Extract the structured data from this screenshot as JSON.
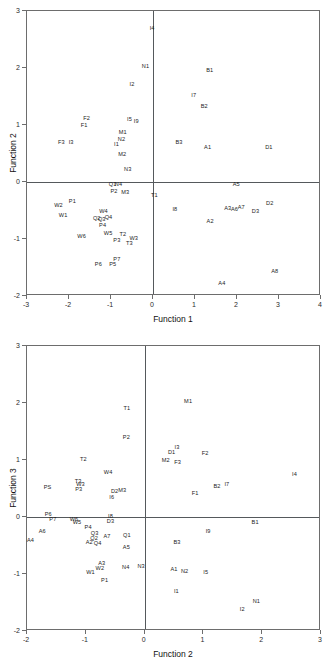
{
  "figure": {
    "background": "#ffffff",
    "axis_color": "#55595c",
    "label_color": "#1c1c1c"
  },
  "chart_data": [
    {
      "type": "scatter",
      "title": "",
      "xlabel": "Function 1",
      "ylabel": "Function 2",
      "xlim": [
        -3,
        4
      ],
      "ylim": [
        -2,
        3
      ],
      "xticks": [
        -3,
        -2,
        -1,
        0,
        1,
        2,
        3,
        4
      ],
      "xtick_labels": [
        "-3",
        "-2",
        "-1",
        "0",
        "1",
        "2",
        "3",
        "4"
      ],
      "yticks": [
        -2,
        -1,
        0,
        1,
        2,
        3
      ],
      "ytick_labels": [
        "-2",
        "-1",
        "0",
        "1",
        "2",
        "3"
      ],
      "grid": false,
      "legend": "none",
      "origin_axes": true,
      "marker": "text-label-only",
      "points": [
        {
          "label": "I4",
          "x": -0.02,
          "y": 2.7
        },
        {
          "label": "N1",
          "x": -0.18,
          "y": 2.04
        },
        {
          "label": "B1",
          "x": 1.35,
          "y": 1.97
        },
        {
          "label": "I2",
          "x": -0.5,
          "y": 1.72
        },
        {
          "label": "I7",
          "x": 0.97,
          "y": 1.52
        },
        {
          "label": "B2",
          "x": 1.22,
          "y": 1.33
        },
        {
          "label": "F2",
          "x": -1.58,
          "y": 1.13
        },
        {
          "label": "I5",
          "x": -0.56,
          "y": 1.1
        },
        {
          "label": "I9",
          "x": -0.4,
          "y": 1.07
        },
        {
          "label": "F1",
          "x": -1.64,
          "y": 1.0
        },
        {
          "label": "M1",
          "x": -0.72,
          "y": 0.87
        },
        {
          "label": "N2",
          "x": -0.75,
          "y": 0.75
        },
        {
          "label": "F3",
          "x": -2.18,
          "y": 0.7
        },
        {
          "label": "I3",
          "x": -1.95,
          "y": 0.71
        },
        {
          "label": "I1",
          "x": -0.87,
          "y": 0.67
        },
        {
          "label": "B3",
          "x": 0.62,
          "y": 0.71
        },
        {
          "label": "A1",
          "x": 1.3,
          "y": 0.62
        },
        {
          "label": "D1",
          "x": 2.76,
          "y": 0.62
        },
        {
          "label": "M2",
          "x": -0.73,
          "y": 0.49
        },
        {
          "label": "N3",
          "x": -0.6,
          "y": 0.22
        },
        {
          "label": "Q1",
          "x": -0.96,
          "y": -0.04
        },
        {
          "label": "N4",
          "x": -0.82,
          "y": -0.04
        },
        {
          "label": "A5",
          "x": 1.98,
          "y": -0.03
        },
        {
          "label": "P2",
          "x": -0.93,
          "y": -0.16
        },
        {
          "label": "M3",
          "x": -0.66,
          "y": -0.17
        },
        {
          "label": "T1",
          "x": 0.03,
          "y": -0.22
        },
        {
          "label": "P1",
          "x": -1.92,
          "y": -0.33
        },
        {
          "label": "D2",
          "x": 2.78,
          "y": -0.36
        },
        {
          "label": "W2",
          "x": -2.25,
          "y": -0.4
        },
        {
          "label": "I8",
          "x": 0.52,
          "y": -0.48
        },
        {
          "label": "A3",
          "x": 1.78,
          "y": -0.45
        },
        {
          "label": "A6",
          "x": 1.94,
          "y": -0.48
        },
        {
          "label": "A7",
          "x": 2.1,
          "y": -0.44
        },
        {
          "label": "D3",
          "x": 2.44,
          "y": -0.5
        },
        {
          "label": "W4",
          "x": -1.18,
          "y": -0.5
        },
        {
          "label": "W1",
          "x": -2.14,
          "y": -0.58
        },
        {
          "label": "Q2",
          "x": -1.34,
          "y": -0.63
        },
        {
          "label": "Q3",
          "x": -1.22,
          "y": -0.65
        },
        {
          "label": "Q4",
          "x": -1.06,
          "y": -0.62
        },
        {
          "label": "A2",
          "x": 1.36,
          "y": -0.68
        },
        {
          "label": "P4",
          "x": -1.2,
          "y": -0.76
        },
        {
          "label": "W5",
          "x": -1.07,
          "y": -0.9
        },
        {
          "label": "W6",
          "x": -1.7,
          "y": -0.95
        },
        {
          "label": "T2",
          "x": -0.72,
          "y": -0.91
        },
        {
          "label": "W3",
          "x": -0.46,
          "y": -0.98
        },
        {
          "label": "P3",
          "x": -0.86,
          "y": -1.01
        },
        {
          "label": "T3",
          "x": -0.56,
          "y": -1.07
        },
        {
          "label": "P7",
          "x": -0.86,
          "y": -1.35
        },
        {
          "label": "P6",
          "x": -1.3,
          "y": -1.43
        },
        {
          "label": "P5",
          "x": -0.96,
          "y": -1.43
        },
        {
          "label": "A8",
          "x": 2.9,
          "y": -1.56
        },
        {
          "label": "A4",
          "x": 1.64,
          "y": -1.78
        }
      ]
    },
    {
      "type": "scatter",
      "title": "",
      "xlabel": "Function 2",
      "ylabel": "Function 3",
      "xlim": [
        -2,
        3
      ],
      "ylim": [
        -2,
        3
      ],
      "xticks": [
        -2,
        -1,
        0,
        1,
        2,
        3
      ],
      "xtick_labels": [
        "-2",
        "-1",
        "0",
        "1",
        "2",
        "3"
      ],
      "yticks": [
        -2,
        -1,
        0,
        1,
        2,
        3
      ],
      "ytick_labels": [
        "-2",
        "-1",
        "0",
        "1",
        "2",
        "3"
      ],
      "grid": false,
      "legend": "none",
      "origin_axes": true,
      "marker": "text-label-only",
      "points": [
        {
          "label": "M1",
          "x": 0.74,
          "y": 2.03
        },
        {
          "label": "T1",
          "x": -0.3,
          "y": 1.92
        },
        {
          "label": "P2",
          "x": -0.31,
          "y": 1.4
        },
        {
          "label": "I3",
          "x": 0.55,
          "y": 1.22
        },
        {
          "label": "D1",
          "x": 0.46,
          "y": 1.14
        },
        {
          "label": "F2",
          "x": 1.03,
          "y": 1.13
        },
        {
          "label": "T2",
          "x": -1.04,
          "y": 1.02
        },
        {
          "label": "M2",
          "x": 0.36,
          "y": 1.0
        },
        {
          "label": "F3",
          "x": 0.56,
          "y": 0.97
        },
        {
          "label": "W4",
          "x": -0.62,
          "y": 0.79
        },
        {
          "label": "I4",
          "x": 2.55,
          "y": 0.76
        },
        {
          "label": "T3",
          "x": -1.13,
          "y": 0.64
        },
        {
          "label": "W3",
          "x": -1.09,
          "y": 0.58
        },
        {
          "label": "B2",
          "x": 1.23,
          "y": 0.55
        },
        {
          "label": "I7",
          "x": 1.4,
          "y": 0.58
        },
        {
          "label": "PS",
          "x": -1.65,
          "y": 0.52
        },
        {
          "label": "P3",
          "x": -1.12,
          "y": 0.5
        },
        {
          "label": "D2",
          "x": -0.51,
          "y": 0.46
        },
        {
          "label": "M3",
          "x": -0.38,
          "y": 0.48
        },
        {
          "label": "F1",
          "x": 0.86,
          "y": 0.42
        },
        {
          "label": "I6",
          "x": -0.56,
          "y": 0.35
        },
        {
          "label": "P6",
          "x": -1.64,
          "y": 0.05
        },
        {
          "label": "I8",
          "x": -0.58,
          "y": 0.02
        },
        {
          "label": "P7",
          "x": -1.56,
          "y": -0.04
        },
        {
          "label": "W6",
          "x": -1.2,
          "y": -0.03
        },
        {
          "label": "D3",
          "x": -0.58,
          "y": -0.07
        },
        {
          "label": "B1",
          "x": 1.88,
          "y": -0.08
        },
        {
          "label": "W5",
          "x": -1.15,
          "y": -0.09
        },
        {
          "label": "P4",
          "x": -0.96,
          "y": -0.18
        },
        {
          "label": "A6",
          "x": -1.74,
          "y": -0.25
        },
        {
          "label": "Q3",
          "x": -0.85,
          "y": -0.28
        },
        {
          "label": "I9",
          "x": 1.08,
          "y": -0.25
        },
        {
          "label": "A7",
          "x": -0.64,
          "y": -0.33
        },
        {
          "label": "Q1",
          "x": -0.3,
          "y": -0.31
        },
        {
          "label": "Q2",
          "x": -0.86,
          "y": -0.37
        },
        {
          "label": "A4",
          "x": -1.94,
          "y": -0.41
        },
        {
          "label": "A2",
          "x": -0.94,
          "y": -0.44
        },
        {
          "label": "Q4",
          "x": -0.8,
          "y": -0.46
        },
        {
          "label": "B3",
          "x": 0.55,
          "y": -0.44
        },
        {
          "label": "A5",
          "x": -0.31,
          "y": -0.52
        },
        {
          "label": "A3",
          "x": -0.73,
          "y": -0.81
        },
        {
          "label": "N4",
          "x": -0.32,
          "y": -0.88
        },
        {
          "label": "N3",
          "x": -0.06,
          "y": -0.86
        },
        {
          "label": "W2",
          "x": -0.76,
          "y": -0.89
        },
        {
          "label": "A1",
          "x": 0.5,
          "y": -0.92
        },
        {
          "label": "N2",
          "x": 0.68,
          "y": -0.94
        },
        {
          "label": "W1",
          "x": -0.92,
          "y": -0.96
        },
        {
          "label": "I5",
          "x": 1.04,
          "y": -0.97
        },
        {
          "label": "P1",
          "x": -0.68,
          "y": -1.1
        },
        {
          "label": "I1",
          "x": 0.54,
          "y": -1.3
        },
        {
          "label": "N1",
          "x": 1.9,
          "y": -1.48
        },
        {
          "label": "I2",
          "x": 1.66,
          "y": -1.62
        }
      ]
    }
  ]
}
